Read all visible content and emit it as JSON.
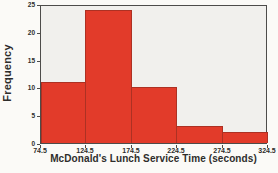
{
  "chart_data": {
    "type": "bar",
    "subtype": "histogram",
    "title": "",
    "xlabel": "McDonald's Lunch Service Time (seconds)",
    "ylabel": "Frequency",
    "bin_edges": [
      74.5,
      124.5,
      174.5,
      224.5,
      274.5,
      324.5
    ],
    "x_tick_labels": [
      "74.5",
      "124.5",
      "174.5",
      "224.5",
      "274.5",
      "324.5"
    ],
    "y_ticks": [
      0,
      5,
      10,
      15,
      20,
      25
    ],
    "frequencies": [
      11,
      24,
      10,
      3,
      2
    ],
    "ylim": [
      0,
      25
    ],
    "grid": false,
    "legend": "none",
    "colors": {
      "bar_fill": "#e23b2a",
      "bar_border": "#ad3123",
      "plot_background": "#f1f0ed",
      "plot_border": "#4d4c4a",
      "page_background": "#fbfaf7",
      "text": "#2e2d2b"
    }
  }
}
